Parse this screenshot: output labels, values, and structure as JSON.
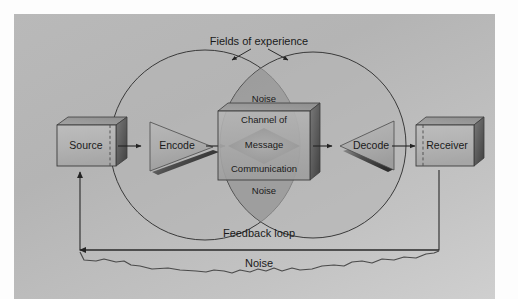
{
  "diagram": {
    "background_color": "#bcbcbc",
    "stroke_color": "#3a3a3a",
    "text_color": "#1a1a1a",
    "annotations": {
      "fields_of_experience": "Fields of experience",
      "feedback_loop": "Feedback loop",
      "noise_bottom": "Noise"
    },
    "nodes": [
      {
        "id": "source",
        "label": "Source",
        "shape": "box-3d",
        "fill": "#b0b0b0"
      },
      {
        "id": "encode",
        "label": "Encode",
        "shape": "triangle-right",
        "fill": "#a8a8a8"
      },
      {
        "id": "channel",
        "label": "Channel of",
        "shape": "box-3d",
        "fill": "#a5a5a5"
      },
      {
        "id": "decode",
        "label": "Decode",
        "shape": "triangle-left",
        "fill": "#a8a8a8"
      },
      {
        "id": "receiver",
        "label": "Receiver",
        "shape": "box-3d",
        "fill": "#b0b0b0"
      }
    ],
    "center_stack": {
      "noise_top": "Noise",
      "channel_line1": "Channel of",
      "message": "Message",
      "channel_line2": "Communication",
      "noise_bottom": "Noise"
    },
    "circles": [
      {
        "id": "left-field",
        "label": "Fields of experience",
        "cx": 205,
        "cy": 145,
        "r": 95,
        "fill": "#b7b7b7"
      },
      {
        "id": "right-field",
        "label": "Fields of experience",
        "cx": 313,
        "cy": 145,
        "r": 93,
        "fill": "#b7b7b7"
      }
    ],
    "overlap": {
      "id": "vesica",
      "label": "Message / Noise overlap",
      "fill": "#9a9a9a"
    },
    "flow": [
      "Source",
      "Encode",
      "Channel of Communication",
      "Decode",
      "Receiver"
    ]
  }
}
